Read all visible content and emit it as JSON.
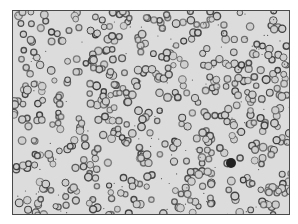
{
  "image": {
    "subject": "blood smear micrograph",
    "description": "Grayscale light micrograph showing densely scattered red blood cells as dark rings on a pale background, with one dark-stained white blood cell near the lower right.",
    "colors": {
      "background": "#dcdcdc",
      "cell_ring": "#3a3a3a",
      "cell_center": "#cfcfcf",
      "leukocyte": "#222222",
      "page": "#ffffff"
    },
    "features": [
      {
        "label": "erythrocytes",
        "count_estimate": "~500"
      },
      {
        "label": "leukocyte",
        "position": "lower right",
        "x": 230,
        "y": 162
      }
    ]
  }
}
